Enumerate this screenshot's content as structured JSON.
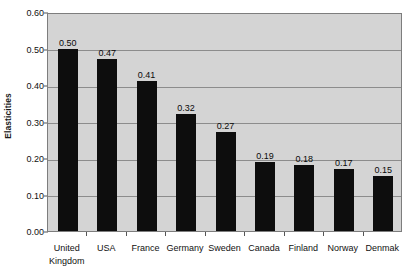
{
  "chart_data": {
    "type": "bar",
    "title": "",
    "xlabel": "",
    "ylabel": "Elasticities",
    "ylim": [
      0.0,
      0.6
    ],
    "ytick_labels": [
      "0.00",
      "0.10",
      "0.20",
      "0.30",
      "0.40",
      "0.50",
      "0.60"
    ],
    "ytick_values": [
      0.0,
      0.1,
      0.2,
      0.3,
      0.4,
      0.5,
      0.6
    ],
    "grid": true,
    "legend": false,
    "legend_position": "none",
    "bar_color": "#0d0d0d",
    "plot_background": "#d4d4d4",
    "gridline_color": "#8c8c8c",
    "categories": [
      "United\nKingdom",
      "USA",
      "France",
      "Germany",
      "Sweden",
      "Canada",
      "Finland",
      "Norway",
      "Denmak"
    ],
    "values": [
      0.5,
      0.47,
      0.41,
      0.32,
      0.27,
      0.19,
      0.18,
      0.17,
      0.15
    ],
    "value_labels": [
      "0.50",
      "0.47",
      "0.41",
      "0.32",
      "0.27",
      "0.19",
      "0.18",
      "0.17",
      "0.15"
    ]
  }
}
